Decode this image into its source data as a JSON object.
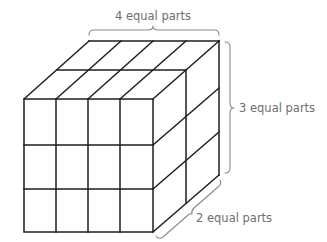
{
  "diagram": {
    "labels": {
      "width": "4 equal parts",
      "height": "3 equal parts",
      "depth": "2 equal parts"
    },
    "dimensions": {
      "width_parts": 4,
      "height_parts": 3,
      "depth_parts": 2
    },
    "colors": {
      "edges": "#1e1e1e",
      "braces": "#8a8a8a",
      "text": "#6e6e6e",
      "background": "#ffffff"
    }
  }
}
